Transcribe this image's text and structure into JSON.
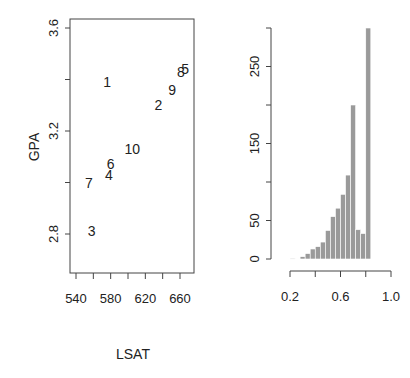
{
  "chart_data": [
    {
      "type": "scatter",
      "title": "",
      "xlabel": "LSAT",
      "ylabel": "GPA",
      "xlim": [
        535,
        670
      ],
      "ylim": [
        2.69,
        3.63
      ],
      "xticks": [
        540,
        560,
        580,
        600,
        620,
        640,
        660
      ],
      "xtick_labels": [
        "540",
        "",
        "580",
        "",
        "620",
        "",
        "660"
      ],
      "yticks": [
        2.8,
        3.0,
        3.2,
        3.4,
        3.6
      ],
      "ytick_labels": [
        "2.8",
        "",
        "3.2",
        "",
        "3.6"
      ],
      "grid": false,
      "marker": "text-labels",
      "points": [
        {
          "label": "1",
          "x": 576,
          "y": 3.39
        },
        {
          "label": "2",
          "x": 635,
          "y": 3.3
        },
        {
          "label": "3",
          "x": 558,
          "y": 2.81
        },
        {
          "label": "4",
          "x": 578,
          "y": 3.03
        },
        {
          "label": "5",
          "x": 666,
          "y": 3.44
        },
        {
          "label": "6",
          "x": 580,
          "y": 3.07
        },
        {
          "label": "7",
          "x": 555,
          "y": 3.0
        },
        {
          "label": "8",
          "x": 661,
          "y": 3.43
        },
        {
          "label": "9",
          "x": 651,
          "y": 3.36
        },
        {
          "label": "10",
          "x": 605,
          "y": 3.13
        }
      ]
    },
    {
      "type": "bar",
      "subtype": "histogram",
      "title": "",
      "xlabel": "",
      "ylabel": "",
      "xlim": [
        0.2,
        1.0
      ],
      "ylim": [
        0,
        300
      ],
      "xticks": [
        0.2,
        0.4,
        0.6,
        0.8,
        1.0
      ],
      "xtick_labels": [
        "0.2",
        "",
        "0.6",
        "",
        "1.0"
      ],
      "yticks": [
        0,
        50,
        100,
        150,
        200,
        250,
        300
      ],
      "ytick_labels": [
        "0",
        "50",
        "",
        "150",
        "",
        "250",
        ""
      ],
      "grid": false,
      "bin_width": 0.04,
      "categories": [
        "0.22",
        "0.30",
        "0.34",
        "0.38",
        "0.42",
        "0.46",
        "0.50",
        "0.54",
        "0.58",
        "0.62",
        "0.66",
        "0.70",
        "0.74",
        "0.78",
        "0.82"
      ],
      "bins": [
        {
          "x0": 0.2,
          "x1": 0.24,
          "count": 1
        },
        {
          "x0": 0.28,
          "x1": 0.32,
          "count": 3
        },
        {
          "x0": 0.32,
          "x1": 0.36,
          "count": 7
        },
        {
          "x0": 0.36,
          "x1": 0.4,
          "count": 13
        },
        {
          "x0": 0.4,
          "x1": 0.44,
          "count": 16
        },
        {
          "x0": 0.44,
          "x1": 0.48,
          "count": 22
        },
        {
          "x0": 0.48,
          "x1": 0.52,
          "count": 37
        },
        {
          "x0": 0.52,
          "x1": 0.56,
          "count": 55
        },
        {
          "x0": 0.56,
          "x1": 0.6,
          "count": 66
        },
        {
          "x0": 0.6,
          "x1": 0.64,
          "count": 84
        },
        {
          "x0": 0.64,
          "x1": 0.68,
          "count": 109
        },
        {
          "x0": 0.68,
          "x1": 0.72,
          "count": 200
        },
        {
          "x0": 0.72,
          "x1": 0.76,
          "count": 38
        },
        {
          "x0": 0.76,
          "x1": 0.8,
          "count": 33
        },
        {
          "x0": 0.8,
          "x1": 0.84,
          "count": 300
        }
      ],
      "values": [
        1,
        3,
        7,
        13,
        16,
        22,
        37,
        55,
        66,
        84,
        109,
        200,
        38,
        33,
        300
      ],
      "bar_color": "#9a9a9a"
    }
  ]
}
